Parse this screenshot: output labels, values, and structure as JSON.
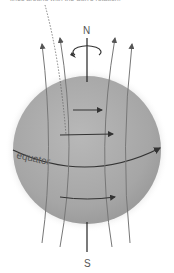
{
  "caption": "lines around with the Sun's rotation.",
  "labels": {
    "north": "N",
    "south": "S",
    "equator": "equator"
  },
  "colors": {
    "sphere": "#a9a9a9",
    "field_lines": "#777777",
    "arrows": "#444444",
    "axis": "#222222"
  }
}
